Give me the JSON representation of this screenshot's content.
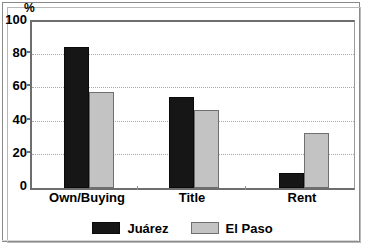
{
  "axis": {
    "unit_label": "%",
    "y_ticks": [
      "100",
      "80",
      "60",
      "40",
      "20",
      "0"
    ],
    "y_tick_values": [
      100,
      80,
      60,
      40,
      20,
      0
    ]
  },
  "legend": {
    "entries": [
      {
        "label": "Juárez",
        "swatch": "black-square-swatch",
        "color": "#161616"
      },
      {
        "label": "El Paso",
        "swatch": "gray-square-swatch",
        "color": "#c3c3c3"
      }
    ]
  },
  "categories": [
    "Own/Buying",
    "Title",
    "Rent"
  ],
  "chart_data": {
    "type": "bar",
    "title": "",
    "subtitle": "",
    "xlabel": "",
    "ylabel": "%",
    "ylim": [
      0,
      100
    ],
    "yticks": [
      0,
      20,
      40,
      60,
      80,
      100
    ],
    "grid": "horizontal-dotted",
    "legend_position": "bottom-center",
    "categories": [
      "Own/Buying",
      "Title",
      "Rent"
    ],
    "series": [
      {
        "name": "Juárez",
        "color": "#161616",
        "values": [
          85,
          55,
          9
        ]
      },
      {
        "name": "El Paso",
        "color": "#c3c3c3",
        "values": [
          58,
          47,
          33
        ]
      }
    ]
  }
}
